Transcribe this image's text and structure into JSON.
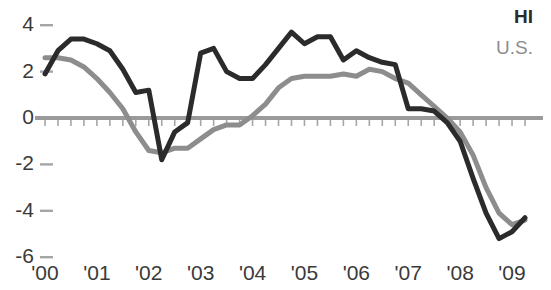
{
  "legend": {
    "hi_label": "HI",
    "us_label": "U.S."
  },
  "axis": {
    "y_ticks": [
      "4",
      "2",
      "0",
      "-2",
      "-4",
      "-6"
    ],
    "x_ticks": [
      "'00",
      "'01",
      "'02",
      "'03",
      "'04",
      "'05",
      "'06",
      "'07",
      "'08",
      "'09"
    ]
  },
  "colors": {
    "hi_line": "#2b2b2b",
    "us_line": "#8d8d8d",
    "zero_axis": "#9a9a9a",
    "tick_mark": "#a6a6a6",
    "text": "#3a3a3a"
  },
  "chart_data": {
    "type": "line",
    "title": "",
    "subtitle": "",
    "xlabel": "",
    "ylabel": "",
    "xlim": [
      2000.0,
      2009.25
    ],
    "ylim": [
      -6.6,
      4.6
    ],
    "grid": false,
    "legend_position": "top-right",
    "tick_interval_quarters": 1,
    "x": [
      2000.0,
      2000.25,
      2000.5,
      2000.75,
      2001.0,
      2001.25,
      2001.5,
      2001.75,
      2002.0,
      2002.25,
      2002.5,
      2002.75,
      2003.0,
      2003.25,
      2003.5,
      2003.75,
      2004.0,
      2004.25,
      2004.5,
      2004.75,
      2005.0,
      2005.25,
      2005.5,
      2005.75,
      2006.0,
      2006.25,
      2006.5,
      2006.75,
      2007.0,
      2007.25,
      2007.5,
      2007.75,
      2008.0,
      2008.25,
      2008.5,
      2008.75,
      2009.0,
      2009.25
    ],
    "x_tick_labels": [
      "'00",
      "'01",
      "'02",
      "'03",
      "'04",
      "'05",
      "'06",
      "'07",
      "'08",
      "'09"
    ],
    "y_tick_values": [
      4,
      2,
      0,
      -2,
      -4,
      -6
    ],
    "series": [
      {
        "name": "HI",
        "color": "#2b2b2b",
        "values": [
          1.9,
          2.9,
          3.4,
          3.4,
          3.2,
          2.9,
          2.1,
          1.1,
          1.2,
          -1.8,
          -0.6,
          -0.2,
          2.8,
          3.0,
          2.0,
          1.7,
          1.7,
          2.3,
          3.0,
          3.7,
          3.2,
          3.5,
          3.5,
          2.5,
          2.9,
          2.6,
          2.4,
          2.3,
          0.4,
          0.4,
          0.3,
          -0.2,
          -1.0,
          -2.6,
          -4.1,
          -5.2,
          -4.9,
          -4.3
        ]
      },
      {
        "name": "U.S.",
        "color": "#8d8d8d",
        "values": [
          2.6,
          2.6,
          2.5,
          2.2,
          1.7,
          1.1,
          0.4,
          -0.6,
          -1.4,
          -1.5,
          -1.3,
          -1.3,
          -0.9,
          -0.5,
          -0.3,
          -0.3,
          0.1,
          0.6,
          1.3,
          1.7,
          1.8,
          1.8,
          1.8,
          1.9,
          1.8,
          2.1,
          2.0,
          1.7,
          1.5,
          1.0,
          0.5,
          0.0,
          -0.6,
          -1.6,
          -3.0,
          -4.1,
          -4.6,
          -4.4
        ]
      }
    ]
  }
}
